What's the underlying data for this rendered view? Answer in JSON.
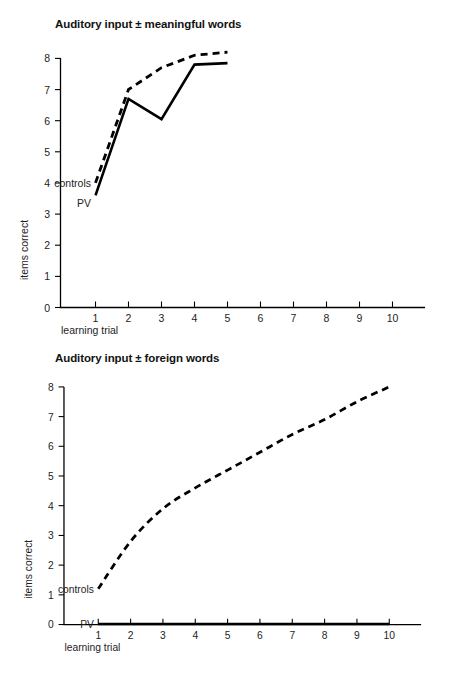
{
  "figure": {
    "ylabel": "items correct",
    "xlabel": "learning trial"
  },
  "panels": [
    {
      "title": "Auditory input ± meaningful words",
      "series_labels": {
        "controls": "controls",
        "pv": "PV"
      }
    },
    {
      "title": "Auditory input ± foreign words",
      "series_labels": {
        "controls": "controls",
        "pv": "PV"
      }
    }
  ],
  "axis": {
    "y_ticks": [
      "0",
      "1",
      "2",
      "3",
      "4",
      "5",
      "6",
      "7",
      "8"
    ],
    "x_ticks": [
      "1",
      "2",
      "3",
      "4",
      "5",
      "6",
      "7",
      "8",
      "9",
      "10"
    ]
  },
  "chart_data": [
    {
      "type": "line",
      "title": "Auditory input ± meaningful words",
      "xlabel": "learning trial",
      "ylabel": "items correct",
      "xlim": [
        0,
        10.5
      ],
      "ylim": [
        0,
        8.6
      ],
      "grid": false,
      "legend": "inline-labels",
      "x": [
        1,
        2,
        3,
        4,
        5
      ],
      "series": [
        {
          "name": "controls",
          "style": "dashed",
          "color": "#000000",
          "values": [
            4.0,
            7.0,
            7.7,
            8.1,
            8.2
          ]
        },
        {
          "name": "PV",
          "style": "solid",
          "color": "#000000",
          "values": [
            3.6,
            6.7,
            6.05,
            7.8,
            7.85
          ]
        }
      ]
    },
    {
      "type": "line",
      "title": "Auditory input ± foreign words",
      "xlabel": "learning trial",
      "ylabel": "items correct",
      "xlim": [
        0,
        10.5
      ],
      "ylim": [
        0,
        8.6
      ],
      "grid": false,
      "legend": "inline-labels",
      "x": [
        1,
        2,
        3,
        4,
        5,
        6,
        7,
        8,
        9,
        10
      ],
      "series": [
        {
          "name": "controls",
          "style": "dashed",
          "color": "#000000",
          "values": [
            1.2,
            2.8,
            3.9,
            4.6,
            5.2,
            5.8,
            6.4,
            6.9,
            7.5,
            8.0
          ]
        },
        {
          "name": "PV",
          "style": "solid",
          "color": "#000000",
          "values": [
            0,
            0,
            0,
            0,
            0,
            0,
            0,
            0,
            0,
            0
          ]
        }
      ]
    }
  ]
}
